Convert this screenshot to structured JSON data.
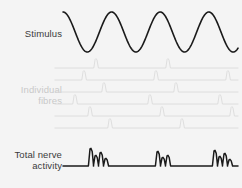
{
  "figure": {
    "background_color": "#f4f4f4",
    "width": 242,
    "height": 188
  },
  "labels": {
    "stimulus": "Stimulus",
    "individual_fibres_line1": "Individual",
    "individual_fibres_line2": "fibres",
    "total_line1": "Total nerve",
    "total_line2": "activity"
  },
  "colors": {
    "stimulus_trace": "#1a1a1a",
    "fibre_trace": "#d8d8d8",
    "fibre_spike": "#bdbdbd",
    "total_trace": "#1a1a1a",
    "label_dark": "#3b3b3b",
    "label_light": "#c9c9c9"
  },
  "chart_data": {
    "type": "line",
    "xlabel": "",
    "ylabel": "",
    "grid": false,
    "legend": "none",
    "panels": [
      {
        "name": "stimulus",
        "label": "Stimulus",
        "trace_type": "sine",
        "cycles": 3.6,
        "amplitude": 20,
        "baseline_y": 32,
        "x_start": 63,
        "x_end": 238,
        "color": "#1a1a1a",
        "line_width": 1.6
      },
      {
        "name": "individual-fibres",
        "label": "Individual fibres",
        "trace_type": "spike-raster",
        "color": "#d8d8d8",
        "spike_color": "#bdbdbd",
        "line_width": 0.8,
        "x_start": 55,
        "x_end": 238,
        "traces": [
          {
            "index": 0,
            "baseline_y": 68,
            "spikes": [
              96,
              168
            ]
          },
          {
            "index": 1,
            "baseline_y": 80,
            "spikes": [
              84,
              156,
              228
            ]
          },
          {
            "index": 2,
            "baseline_y": 92,
            "spikes": [
              104,
              176
            ]
          },
          {
            "index": 3,
            "baseline_y": 104,
            "spikes": [
              75,
              150,
              220
            ]
          },
          {
            "index": 4,
            "baseline_y": 116,
            "spikes": [
              90,
              162,
              232
            ]
          },
          {
            "index": 5,
            "baseline_y": 128,
            "spikes": [
              110,
              182
            ]
          }
        ]
      },
      {
        "name": "total-nerve-activity",
        "label": "Total nerve activity",
        "trace_type": "compound-burst",
        "color": "#1a1a1a",
        "line_width": 1.5,
        "baseline_y": 166,
        "x_start": 63,
        "x_end": 238,
        "bursts": [
          {
            "start": 85,
            "end": 112,
            "peaks": [
              {
                "x": 91,
                "h": 17
              },
              {
                "x": 96,
                "h": 10
              },
              {
                "x": 101,
                "h": 13
              },
              {
                "x": 106,
                "h": 7
              }
            ]
          },
          {
            "start": 152,
            "end": 176,
            "peaks": [
              {
                "x": 158,
                "h": 14
              },
              {
                "x": 163,
                "h": 8
              },
              {
                "x": 168,
                "h": 10
              }
            ]
          },
          {
            "start": 210,
            "end": 236,
            "peaks": [
              {
                "x": 215,
                "h": 15
              },
              {
                "x": 220,
                "h": 9
              },
              {
                "x": 225,
                "h": 12
              },
              {
                "x": 230,
                "h": 6
              }
            ]
          }
        ]
      }
    ]
  }
}
